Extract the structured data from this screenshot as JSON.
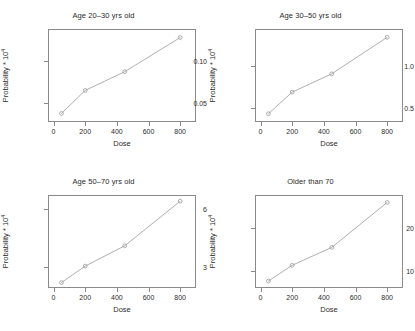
{
  "figure": {
    "background": "#ffffff",
    "line_color": "#9a9a9a",
    "axis_color": "#8a8a8a",
    "text_color": "#2b2b2b",
    "layout": "2x2 grid of line plots"
  },
  "panels": [
    {
      "title": "Age 20–30 yrs old",
      "xlabel": "Dose",
      "ylabel_text": "Probability * 10",
      "ylabel_exp": "4",
      "xticks": [
        "0",
        "200",
        "400",
        "600",
        "800"
      ],
      "xtick_values": [
        0,
        200,
        400,
        600,
        800
      ],
      "yticks": [
        "0.05",
        "0.10"
      ],
      "ytick_values": [
        0.05,
        0.1
      ],
      "xlim": [
        -35,
        900
      ],
      "ylim": [
        0.028,
        0.137
      ]
    },
    {
      "title": "Age 30–50 yrs old",
      "xlabel": "Dose",
      "ylabel_text": "Probability * 10",
      "ylabel_exp": "4",
      "xticks": [
        "0",
        "200",
        "400",
        "600",
        "800"
      ],
      "xtick_values": [
        0,
        200,
        400,
        600,
        800
      ],
      "yticks": [
        "0.5",
        "1.0"
      ],
      "ytick_values": [
        0.5,
        1.0
      ],
      "xlim": [
        -35,
        900
      ],
      "ylim": [
        0.33,
        1.45
      ]
    },
    {
      "title": "Age 50–70 yrs old",
      "xlabel": "Dose",
      "ylabel_text": "Probability * 10",
      "ylabel_exp": "4",
      "xticks": [
        "0",
        "200",
        "400",
        "600",
        "800"
      ],
      "xtick_values": [
        0,
        200,
        400,
        600,
        800
      ],
      "yticks": [
        "3",
        "6"
      ],
      "ytick_values": [
        3,
        6
      ],
      "xlim": [
        -35,
        900
      ],
      "ylim": [
        1.92,
        6.72
      ]
    },
    {
      "title": "Older than 70",
      "xlabel": "Dose",
      "ylabel_text": "Probability * 10",
      "ylabel_exp": "4",
      "xticks": [
        "0",
        "200",
        "400",
        "600",
        "800"
      ],
      "xtick_values": [
        0,
        200,
        400,
        600,
        800
      ],
      "yticks": [
        "10",
        "20"
      ],
      "ytick_values": [
        10,
        20
      ],
      "xlim": [
        -35,
        900
      ],
      "ylim": [
        6.2,
        27.5
      ]
    }
  ],
  "chart_data": [
    {
      "type": "line",
      "title": "Age 20–30 yrs old",
      "xlabel": "Dose",
      "ylabel": "Probability * 10^4",
      "x": [
        50,
        200,
        450,
        800
      ],
      "values": [
        0.038,
        0.065,
        0.087,
        0.127
      ],
      "xlim": [
        -35,
        900
      ],
      "ylim": [
        0.028,
        0.137
      ],
      "xticks": [
        0,
        200,
        400,
        600,
        800
      ],
      "yticks": [
        0.05,
        0.1
      ],
      "grid": false,
      "legend": "none",
      "markers": "open-circle"
    },
    {
      "type": "line",
      "title": "Age 30–50 yrs old",
      "xlabel": "Dose",
      "ylabel": "Probability * 10^4",
      "x": [
        50,
        200,
        450,
        800
      ],
      "values": [
        0.43,
        0.69,
        0.91,
        1.35
      ],
      "xlim": [
        -35,
        900
      ],
      "ylim": [
        0.33,
        1.45
      ],
      "xticks": [
        0,
        200,
        400,
        600,
        800
      ],
      "yticks": [
        0.5,
        1.0
      ],
      "grid": false,
      "legend": "none",
      "markers": "open-circle"
    },
    {
      "type": "line",
      "title": "Age 50–70 yrs old",
      "xlabel": "Dose",
      "ylabel": "Probability * 10^4",
      "x": [
        50,
        200,
        450,
        800
      ],
      "values": [
        2.2,
        3.05,
        4.1,
        6.4
      ],
      "xlim": [
        -35,
        900
      ],
      "ylim": [
        1.92,
        6.72
      ],
      "xticks": [
        0,
        200,
        400,
        600,
        800
      ],
      "yticks": [
        3,
        6
      ],
      "grid": false,
      "legend": "none",
      "markers": "open-circle"
    },
    {
      "type": "line",
      "title": "Older than 70",
      "xlabel": "Dose",
      "ylabel": "Probability * 10^4",
      "x": [
        50,
        200,
        450,
        800
      ],
      "values": [
        7.8,
        11.4,
        15.5,
        25.8
      ],
      "xlim": [
        -35,
        900
      ],
      "ylim": [
        6.2,
        27.5
      ],
      "xticks": [
        0,
        200,
        400,
        600,
        800
      ],
      "yticks": [
        10,
        20
      ],
      "grid": false,
      "legend": "none",
      "markers": "open-circle"
    }
  ]
}
